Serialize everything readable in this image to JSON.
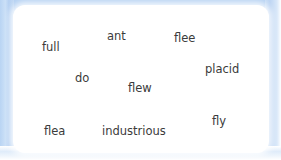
{
  "canvas": {
    "background_color": "#b3d0f2",
    "card_color": "#ffffff",
    "text_color": "#3b3b3b"
  },
  "word_cloud": {
    "words": [
      {
        "text": "full",
        "x": 29,
        "y": 37,
        "size": 11.5
      },
      {
        "text": "ant",
        "x": 94,
        "y": 26,
        "size": 11.5
      },
      {
        "text": "flee",
        "x": 161,
        "y": 28,
        "size": 11.5
      },
      {
        "text": "placid",
        "x": 192,
        "y": 59,
        "size": 11.5
      },
      {
        "text": "do",
        "x": 62,
        "y": 68,
        "size": 11.5
      },
      {
        "text": "flew",
        "x": 115,
        "y": 78,
        "size": 11.5
      },
      {
        "text": "fly",
        "x": 199,
        "y": 111,
        "size": 11.5
      },
      {
        "text": "flea",
        "x": 31,
        "y": 121,
        "size": 11.5
      },
      {
        "text": "industrious",
        "x": 89,
        "y": 121,
        "size": 11.5
      }
    ]
  }
}
